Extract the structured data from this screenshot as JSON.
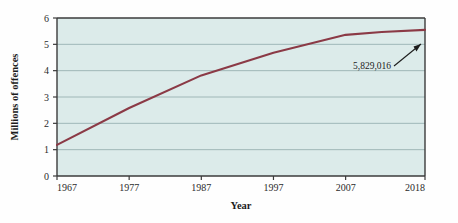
{
  "chart_data": {
    "type": "line",
    "title": "",
    "subtitle": "",
    "xlabel": "Year",
    "ylabel": "Millions of offences",
    "xlim": [
      1967,
      2018
    ],
    "ylim": [
      0,
      6
    ],
    "grid": true,
    "legend": "none",
    "xticks": [
      "1967",
      "1977",
      "1987",
      "1997",
      "2007",
      "2018"
    ],
    "xtick_values": [
      1967,
      1977,
      1987,
      1997,
      2007,
      2018
    ],
    "yticks": [
      "0",
      "1",
      "2",
      "3",
      "4",
      "5",
      "6"
    ],
    "ytick_values": [
      0,
      1,
      2,
      3,
      4,
      5,
      6
    ],
    "series": [
      {
        "name": "Recorded offences",
        "color": "#8b3a46",
        "x": [
          1967,
          1977,
          1987,
          1997,
          2007,
          2012,
          2018
        ],
        "values": [
          1.18,
          2.58,
          3.82,
          4.68,
          5.36,
          5.47,
          5.55
        ]
      }
    ],
    "annotations": [
      {
        "text": "5,829,016",
        "x": 2018,
        "y": 5.55,
        "kind": "arrow-callout"
      }
    ]
  },
  "figure": {
    "plot_background": "#dcebea",
    "page_background": "#fefefe",
    "axis_color": "#3b3b3b",
    "grid_color": "#8fa9ab",
    "line_color": "#8b3a46",
    "text_color": "#1c1c1c"
  }
}
